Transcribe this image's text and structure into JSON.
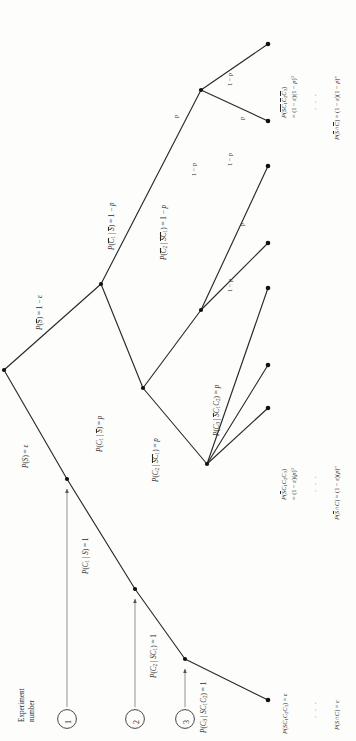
{
  "figure": {
    "type": "probability-tree",
    "orientation": "rotated-90-counterclockwise",
    "caption_group": "Experiment number"
  },
  "axis_note": {
    "line1": "Experiment",
    "line2": "number"
  },
  "experiment_markers": [
    {
      "id": "1",
      "label": "1"
    },
    {
      "id": "2",
      "label": "2"
    },
    {
      "id": "3",
      "label": "3"
    }
  ],
  "branch_labels": {
    "root_upper": "P(S̅) = 1 − ε",
    "root_lower": "P(S) = ε",
    "s_c1": "P(C₁ | S) = 1",
    "s_c1c2": "P(C₂ | SC₁) = 1",
    "s_c1c2c3": "P(C₃ | SC₁C₂) = 1",
    "sbar_c1bar": "P(C̅₁ | S̅) = 1 − p",
    "sbar_c1": "P(C₁ | S̅) = p",
    "sbar_c1bar_c2bar": "P(C̅₂ | S̅C̅₁) = 1 − p",
    "sbar_c1_c2bar": "P(C̅₂ | S̅C₁) = 1 − p",
    "sbar_c1_c2": "P(C₂ | S̅C₁) = p",
    "sbar_c1c2_c3": "P(C₃ | S̅C₁C₂) = p",
    "p": "p",
    "one_minus_p": "1 − p"
  },
  "level3_edge_labels": [
    {
      "id": "e1",
      "text": "1 − p"
    },
    {
      "id": "e2",
      "text": "p"
    },
    {
      "id": "e3",
      "text": "1 − p"
    },
    {
      "id": "e4",
      "text": "p"
    },
    {
      "id": "e5",
      "text": "1 − p"
    },
    {
      "id": "e6",
      "text": "1 − p"
    },
    {
      "id": "e7",
      "text": "p"
    }
  ],
  "outcomes": {
    "top": {
      "line1": "P(S̅C̅₁C̅₂C̅₃)",
      "line2": "= (1 − ε)(1 − p)³"
    },
    "top_general": "P(S̅∩C̅) = (1 − ε)(1 − p)ⁿ",
    "middle": {
      "line1": "P(S̅C₁C₂C₃)",
      "line2": "= (1 − ε)(p)³"
    },
    "middle_general": "P(S̅∩C) = (1 − ε)(p)ⁿ",
    "bottom": "P(SC₁C₂C₃) = ε",
    "bottom_general": "P(S∩C) = ε"
  },
  "ellipsis": "·  ·  ·",
  "colors": {
    "stroke": "#2a2a2a",
    "node": "#111111",
    "background": "#fdfdfc",
    "arrow": "#555555"
  }
}
